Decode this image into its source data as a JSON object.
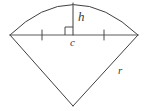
{
  "figure": {
    "name": "circular-sector-with-height-and-chord",
    "background_color": "#ffffff",
    "stroke_color": "#3f3f3f",
    "label_color": "#3a3a3a",
    "stroke_width": 1,
    "canvas": {
      "width": 147,
      "height": 111
    }
  },
  "labels": {
    "height": "h",
    "center": "c",
    "radius": "r"
  },
  "geometry": {
    "apex": {
      "x": 73,
      "y": 106
    },
    "arc_left_end": {
      "x": 10,
      "y": 35
    },
    "arc_right_end": {
      "x": 138,
      "y": 35
    },
    "arc_top": {
      "x": 73,
      "y": 3
    },
    "chord_midpoint": {
      "x": 73,
      "y": 35
    },
    "tick_left": {
      "x": 42,
      "y": 35
    },
    "tick_right": {
      "x": 104,
      "y": 35
    },
    "right_angle_marker": {
      "x": 65,
      "y": 27,
      "size": 8
    }
  },
  "label_positions": {
    "height": {
      "x": 78,
      "y": 21
    },
    "center": {
      "x": 70,
      "y": 46
    },
    "radius": {
      "x": 118,
      "y": 74
    }
  }
}
